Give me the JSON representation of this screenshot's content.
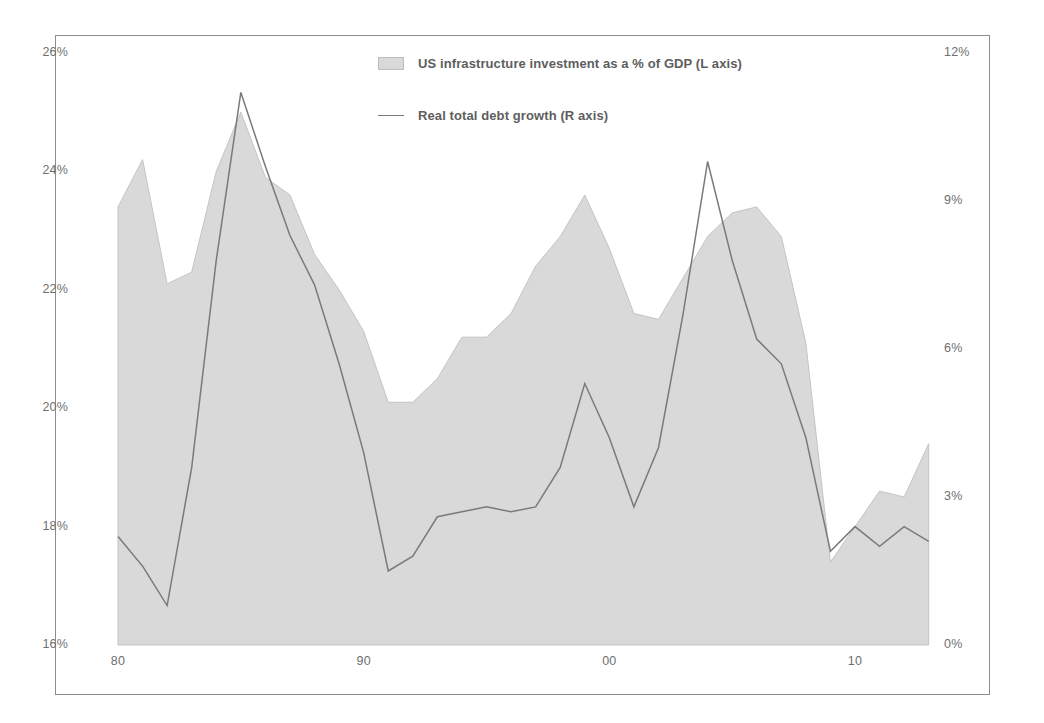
{
  "chart_data": {
    "type": "area",
    "title": "",
    "subtitle": "",
    "xlabel": "",
    "ylabel": "",
    "grid": false,
    "legend_position": "top-center",
    "x": [
      1980,
      1981,
      1982,
      1983,
      1984,
      1985,
      1986,
      1987,
      1988,
      1989,
      1990,
      1991,
      1992,
      1993,
      1994,
      1995,
      1996,
      1997,
      1998,
      1999,
      2000,
      2001,
      2002,
      2003,
      2004,
      2005,
      2006,
      2007,
      2008,
      2009,
      2010,
      2011,
      2012,
      2013
    ],
    "x_tick_labels": [
      "80",
      "90",
      "00",
      "10"
    ],
    "x_tick_values": [
      1980,
      1990,
      2000,
      2010
    ],
    "xlim": [
      1980,
      2013
    ],
    "left_axis": {
      "label": "US infrastructure investment as a % of GDP",
      "ylim": [
        16,
        26
      ],
      "ticks": [
        16,
        18,
        20,
        22,
        24,
        26
      ],
      "tick_labels": [
        "16%",
        "18%",
        "20%",
        "22%",
        "24%",
        "26%"
      ]
    },
    "right_axis": {
      "label": "Real total debt growth",
      "ylim": [
        0,
        12
      ],
      "ticks": [
        0,
        3,
        6,
        9,
        12
      ],
      "tick_labels": [
        "0%",
        "3%",
        "6%",
        "9%",
        "12%"
      ]
    },
    "series": [
      {
        "name": "US infrastructure investment as a % of GDP (L axis)",
        "short_name": "infrastructure-investment",
        "type": "area",
        "axis": "left",
        "color": "#d9d9d9",
        "edge_color": "#c4c4c4",
        "values": [
          23.4,
          24.2,
          22.1,
          22.3,
          24.0,
          25.0,
          23.9,
          23.6,
          22.6,
          22.0,
          21.3,
          20.1,
          20.1,
          20.5,
          21.2,
          21.2,
          21.6,
          22.4,
          22.9,
          23.6,
          22.7,
          21.6,
          21.5,
          22.2,
          22.9,
          23.3,
          23.4,
          22.9,
          21.1,
          17.4,
          18.0,
          18.6,
          18.5,
          19.4
        ]
      },
      {
        "name": "Real total debt growth (R axis)",
        "short_name": "real-total-debt-growth",
        "type": "line",
        "axis": "right",
        "color": "#7a7a7a",
        "values": [
          2.2,
          1.6,
          0.8,
          3.6,
          7.8,
          11.2,
          9.7,
          8.3,
          7.3,
          5.7,
          3.9,
          1.5,
          1.8,
          2.6,
          2.7,
          2.8,
          2.7,
          2.8,
          3.6,
          5.3,
          4.2,
          2.8,
          4.0,
          6.7,
          9.8,
          7.8,
          6.2,
          5.7,
          4.2,
          1.9,
          2.4,
          2.0,
          2.4,
          2.1
        ]
      }
    ]
  },
  "legend": {
    "entries": [
      {
        "marker": "area-swatch",
        "label": "US infrastructure investment as a % of GDP (L axis)"
      },
      {
        "marker": "line-swatch",
        "label": "Real total debt growth (R axis)"
      }
    ]
  },
  "colors": {
    "area_fill": "#d9d9d9",
    "line_stroke": "#7a7a7a",
    "frame": "#8d8d8d",
    "tick_text": "#6f6f6f",
    "legend_text": "#5e5e5e",
    "background": "#ffffff"
  }
}
